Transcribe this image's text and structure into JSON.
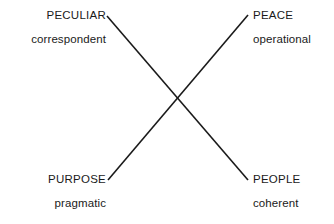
{
  "diagram": {
    "type": "matching-pairs-x-crossing",
    "background_color": "#ffffff",
    "line_color": "#1a1a1a",
    "groups": {
      "top_left": {
        "primary": "PECULIAR",
        "secondary": "correspondent"
      },
      "top_right": {
        "primary": "PEACE",
        "secondary": "operational"
      },
      "bottom_left": {
        "primary": "PURPOSE",
        "secondary": "pragmatic"
      },
      "bottom_right": {
        "primary": "PEOPLE",
        "secondary": "coherent"
      }
    },
    "connectors": [
      {
        "name": "peculiar-to-people",
        "from": "top_left",
        "to": "bottom_right",
        "x1": 107,
        "y1": 16,
        "x2": 248,
        "y2": 180
      },
      {
        "name": "peace-to-purpose",
        "from": "top_right",
        "to": "bottom_left",
        "x1": 248,
        "y1": 15,
        "x2": 108,
        "y2": 180
      }
    ]
  }
}
